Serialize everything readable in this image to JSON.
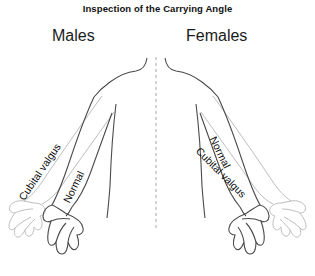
{
  "figure": {
    "title": "Inspection of the Carrying Angle",
    "background_color": "#ffffff",
    "line_color": "#3c3c3c",
    "ghost_line_color": "#b8b8b8",
    "midline_color": "#b0b0b0",
    "text_color": "#111111"
  },
  "groups": {
    "left": {
      "label": "Males"
    },
    "right": {
      "label": "Females"
    }
  },
  "annotations": {
    "male_cubital_valgus": "Cubital valgus",
    "male_normal": "Normal",
    "female_normal": "Normal",
    "female_cubital_valgus": "Cubital valgus"
  },
  "icons": {
    "torso": "torso-outline-icon",
    "midline": "dashed-midline-icon",
    "arm_normal": "arm-normal-icon",
    "arm_valgus": "arm-cubital-valgus-icon",
    "hand": "hand-outline-icon"
  }
}
